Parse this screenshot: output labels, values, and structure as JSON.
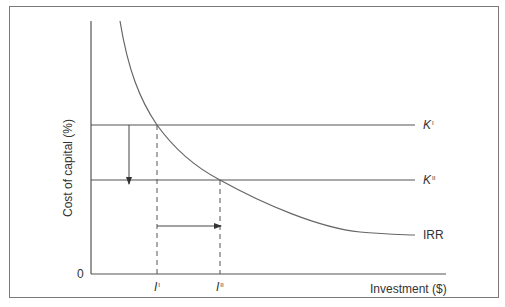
{
  "diagram": {
    "title": "",
    "y_axis": {
      "label": "Cost of capital (%)",
      "origin_label": "0"
    },
    "x_axis": {
      "label": "Investment ($)"
    },
    "lines": [
      {
        "id": "K1",
        "label": "K",
        "subscript": "I",
        "type": "horizontal"
      },
      {
        "id": "K2",
        "label": "K",
        "subscript": "II",
        "type": "horizontal"
      }
    ],
    "curve": {
      "label": "IRR",
      "type": "downward-sloping"
    },
    "x_markers": [
      {
        "label": "I",
        "subscript": "I"
      },
      {
        "label": "I",
        "subscript": "II"
      }
    ],
    "arrows": [
      {
        "id": "cost-down",
        "direction": "down",
        "from": "K1",
        "to": "K2"
      },
      {
        "id": "investment-right",
        "direction": "right",
        "from": "I1",
        "to": "I2"
      }
    ],
    "colors": {
      "line": "#555555",
      "frame": "#7a7a7a",
      "text": "#333333",
      "background": "#ffffff"
    }
  }
}
